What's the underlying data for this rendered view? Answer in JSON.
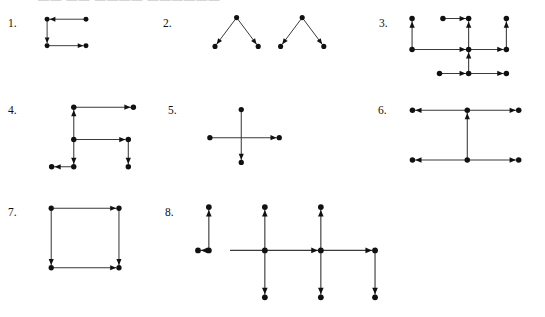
{
  "page": {
    "width": 545,
    "height": 317,
    "background_color": "#ffffff",
    "ink_color": "#111111",
    "line_color": "#3a3a3a",
    "faint_header_text": "—— ——  ————  ——————"
  },
  "problems": [
    {
      "number": "1.",
      "label_x": 8,
      "label_y": 18,
      "fig_x": 30,
      "fig_y": 8,
      "fig_w": 70,
      "fig_h": 45,
      "description": "Two horizontal segments joined by a left vertical segment; top arrow points left, vertical arrow points down, bottom arrow points right.",
      "nodes": [
        {
          "name": "n-top-left",
          "x": 8,
          "y": 8
        },
        {
          "name": "n-top-right",
          "x": 58,
          "y": 8
        },
        {
          "name": "n-bottom-left",
          "x": 8,
          "y": 42
        },
        {
          "name": "n-bottom-right",
          "x": 58,
          "y": 42
        }
      ],
      "edges": [
        {
          "name": "edge-top",
          "x1": 58,
          "y1": 8,
          "x2": 8,
          "y2": 8,
          "arrow": "end"
        },
        {
          "name": "edge-left",
          "x1": 8,
          "y1": 8,
          "x2": 8,
          "y2": 42,
          "arrow": "end"
        },
        {
          "name": "edge-bottom",
          "x1": 8,
          "y1": 42,
          "x2": 58,
          "y2": 42,
          "arrow": "end"
        }
      ]
    },
    {
      "number": "2.",
      "label_x": 163,
      "label_y": 18,
      "fig_x": 192,
      "fig_y": 8,
      "fig_w": 150,
      "fig_h": 48,
      "description": "Two separate inverted-V (peak) shapes; each peak node sends one arrow down-left and one arrow down-right.",
      "nodes": [
        {
          "name": "n-peak-a",
          "x": 33,
          "y": 6
        },
        {
          "name": "n-left-a",
          "x": 6,
          "y": 42
        },
        {
          "name": "n-right-a",
          "x": 60,
          "y": 42
        },
        {
          "name": "n-peak-b",
          "x": 115,
          "y": 6
        },
        {
          "name": "n-left-b",
          "x": 88,
          "y": 42
        },
        {
          "name": "n-right-b",
          "x": 142,
          "y": 42
        }
      ],
      "edges": [
        {
          "name": "edge-a-left",
          "x1": 33,
          "y1": 6,
          "x2": 6,
          "y2": 42,
          "arrow": "end"
        },
        {
          "name": "edge-a-right",
          "x1": 33,
          "y1": 6,
          "x2": 60,
          "y2": 42,
          "arrow": "end"
        },
        {
          "name": "edge-b-left",
          "x1": 115,
          "y1": 6,
          "x2": 88,
          "y2": 42,
          "arrow": "end"
        },
        {
          "name": "edge-b-right",
          "x1": 115,
          "y1": 6,
          "x2": 142,
          "y2": 42,
          "arrow": "end"
        }
      ]
    },
    {
      "number": "3.",
      "label_x": 379,
      "label_y": 18,
      "fig_x": 398,
      "fig_y": 10,
      "fig_w": 125,
      "fig_h": 72,
      "description": "Grid-like network: a central hub with up, right and left connections plus an upper branch and a lower branch.",
      "nodes": [
        {
          "name": "n-tl",
          "x": 2,
          "y": 4
        },
        {
          "name": "n-top-mid-left",
          "x": 38,
          "y": 4
        },
        {
          "name": "n-hub-top",
          "x": 68,
          "y": 4
        },
        {
          "name": "n-tr",
          "x": 112,
          "y": 4
        },
        {
          "name": "n-left-mid",
          "x": 2,
          "y": 40
        },
        {
          "name": "n-hub",
          "x": 68,
          "y": 40
        },
        {
          "name": "n-right-mid",
          "x": 112,
          "y": 40
        },
        {
          "name": "n-bottom-left",
          "x": 34,
          "y": 68
        },
        {
          "name": "n-bottom-hub",
          "x": 68,
          "y": 68
        },
        {
          "name": "n-bottom-right",
          "x": 112,
          "y": 68
        }
      ],
      "edges": [
        {
          "name": "edge-left-up",
          "x1": 2,
          "y1": 40,
          "x2": 2,
          "y2": 4,
          "arrow": "end"
        },
        {
          "name": "edge-top-right",
          "x1": 38,
          "y1": 4,
          "x2": 68,
          "y2": 4,
          "arrow": "end"
        },
        {
          "name": "edge-hub-up",
          "x1": 68,
          "y1": 40,
          "x2": 68,
          "y2": 4,
          "arrow": "end"
        },
        {
          "name": "edge-right-up",
          "x1": 112,
          "y1": 40,
          "x2": 112,
          "y2": 4,
          "arrow": "end"
        },
        {
          "name": "edge-mid-right",
          "x1": 2,
          "y1": 40,
          "x2": 68,
          "y2": 40,
          "arrow": "end"
        },
        {
          "name": "edge-hub-right",
          "x1": 68,
          "y1": 40,
          "x2": 112,
          "y2": 40,
          "arrow": "end"
        },
        {
          "name": "edge-bottom-up",
          "x1": 68,
          "y1": 68,
          "x2": 68,
          "y2": 40,
          "arrow": "end"
        },
        {
          "name": "edge-bottom-left-right",
          "x1": 34,
          "y1": 68,
          "x2": 68,
          "y2": 68,
          "arrow": "end"
        },
        {
          "name": "edge-bottom-hub-right",
          "x1": 68,
          "y1": 68,
          "x2": 112,
          "y2": 68,
          "arrow": "end"
        }
      ]
    },
    {
      "number": "4.",
      "label_x": 8,
      "label_y": 105,
      "fig_x": 38,
      "fig_y": 98,
      "fig_w": 115,
      "fig_h": 78,
      "description": "Staircase / zigzag path: right arrow at top, up arrow, right arrow in middle, two down arrows and a left arrow at the bottom.",
      "nodes": [
        {
          "name": "n-a",
          "x": 28,
          "y": 4
        },
        {
          "name": "n-b",
          "x": 98,
          "y": 4
        },
        {
          "name": "n-c",
          "x": 28,
          "y": 42
        },
        {
          "name": "n-d",
          "x": 92,
          "y": 42
        },
        {
          "name": "n-e",
          "x": 28,
          "y": 74
        },
        {
          "name": "n-f",
          "x": 92,
          "y": 74
        },
        {
          "name": "n-g",
          "x": 2,
          "y": 74
        }
      ],
      "edges": [
        {
          "name": "edge-top-right",
          "x1": 28,
          "y1": 4,
          "x2": 98,
          "y2": 4,
          "arrow": "end"
        },
        {
          "name": "edge-up",
          "x1": 28,
          "y1": 42,
          "x2": 28,
          "y2": 4,
          "arrow": "end"
        },
        {
          "name": "edge-mid-right",
          "x1": 28,
          "y1": 42,
          "x2": 92,
          "y2": 42,
          "arrow": "end"
        },
        {
          "name": "edge-down-left",
          "x1": 28,
          "y1": 42,
          "x2": 28,
          "y2": 74,
          "arrow": "end"
        },
        {
          "name": "edge-down-right",
          "x1": 92,
          "y1": 42,
          "x2": 92,
          "y2": 74,
          "arrow": "end"
        },
        {
          "name": "edge-bottom-left",
          "x1": 28,
          "y1": 74,
          "x2": 2,
          "y2": 74,
          "arrow": "end"
        }
      ]
    },
    {
      "number": "5.",
      "label_x": 168,
      "label_y": 105,
      "fig_x": 195,
      "fig_y": 100,
      "fig_w": 95,
      "fig_h": 72,
      "description": "Cross / plus shape with no centre node: a long horizontal arrow pointing right crossing a vertical arrow pointing down.",
      "nodes": [
        {
          "name": "n-top",
          "x": 42,
          "y": 4
        },
        {
          "name": "n-left",
          "x": 4,
          "y": 38
        },
        {
          "name": "n-right",
          "x": 88,
          "y": 38
        },
        {
          "name": "n-bottom",
          "x": 42,
          "y": 68
        }
      ],
      "edges": [
        {
          "name": "edge-horizontal",
          "x1": 4,
          "y1": 38,
          "x2": 88,
          "y2": 38,
          "arrow": "end"
        },
        {
          "name": "edge-vertical",
          "x1": 42,
          "y1": 4,
          "x2": 42,
          "y2": 68,
          "arrow": "end"
        }
      ]
    },
    {
      "number": "6.",
      "label_x": 378,
      "label_y": 105,
      "fig_x": 398,
      "fig_y": 100,
      "fig_w": 130,
      "fig_h": 72,
      "description": "Two long horizontal lines joined by a central vertical arrow pointing up; each horizontal line has a left-pointing and a right-pointing arrow.",
      "nodes": [
        {
          "name": "n-top-left",
          "x": 2,
          "y": 6
        },
        {
          "name": "n-top-mid",
          "x": 66,
          "y": 6
        },
        {
          "name": "n-top-right",
          "x": 126,
          "y": 6
        },
        {
          "name": "n-bottom-left",
          "x": 2,
          "y": 64
        },
        {
          "name": "n-bottom-mid",
          "x": 66,
          "y": 64
        },
        {
          "name": "n-bottom-right",
          "x": 126,
          "y": 64
        }
      ],
      "edges": [
        {
          "name": "edge-top-left",
          "x1": 66,
          "y1": 6,
          "x2": 2,
          "y2": 6,
          "arrow": "end"
        },
        {
          "name": "edge-top-right",
          "x1": 66,
          "y1": 6,
          "x2": 126,
          "y2": 6,
          "arrow": "end"
        },
        {
          "name": "edge-vertical-up",
          "x1": 66,
          "y1": 64,
          "x2": 66,
          "y2": 6,
          "arrow": "end"
        },
        {
          "name": "edge-bottom-left",
          "x1": 66,
          "y1": 64,
          "x2": 2,
          "y2": 64,
          "arrow": "end"
        },
        {
          "name": "edge-bottom-right",
          "x1": 66,
          "y1": 64,
          "x2": 126,
          "y2": 64,
          "arrow": "end"
        }
      ]
    },
    {
      "number": "7.",
      "label_x": 8,
      "label_y": 207,
      "fig_x": 38,
      "fig_y": 198,
      "fig_w": 95,
      "fig_h": 80,
      "description": "A square: top edge arrow to the right, bottom edge arrow to the right, both side edges arrows pointing down.",
      "nodes": [
        {
          "name": "n-tl",
          "x": 2,
          "y": 4
        },
        {
          "name": "n-tr",
          "x": 84,
          "y": 4
        },
        {
          "name": "n-bl",
          "x": 2,
          "y": 76
        },
        {
          "name": "n-br",
          "x": 84,
          "y": 76
        }
      ],
      "edges": [
        {
          "name": "edge-top",
          "x1": 2,
          "y1": 4,
          "x2": 84,
          "y2": 4,
          "arrow": "end"
        },
        {
          "name": "edge-left",
          "x1": 2,
          "y1": 4,
          "x2": 2,
          "y2": 76,
          "arrow": "end"
        },
        {
          "name": "edge-right",
          "x1": 84,
          "y1": 4,
          "x2": 84,
          "y2": 76,
          "arrow": "end"
        },
        {
          "name": "edge-bottom",
          "x1": 2,
          "y1": 76,
          "x2": 84,
          "y2": 76,
          "arrow": "end"
        }
      ]
    },
    {
      "number": "8.",
      "label_x": 165,
      "label_y": 207,
      "fig_x": 190,
      "fig_y": 198,
      "fig_w": 240,
      "fig_h": 112,
      "description": "A separate short vertical arrow pointing up with a small left arrow at its base, next to a long horizontal chain of three hubs; each hub has an up arrow and a down arrow, and the horizontal arrows point right.",
      "nodes": [
        {
          "name": "n-iso-top",
          "x": 4,
          "y": 4
        },
        {
          "name": "n-iso-bottom",
          "x": 4,
          "y": 52
        },
        {
          "name": "n-iso-left",
          "x": -8,
          "y": 52
        },
        {
          "name": "n-h1-top",
          "x": 66,
          "y": 4
        },
        {
          "name": "n-h1",
          "x": 66,
          "y": 52
        },
        {
          "name": "n-h1-bottom",
          "x": 66,
          "y": 104
        },
        {
          "name": "n-h2-top",
          "x": 128,
          "y": 4
        },
        {
          "name": "n-h2",
          "x": 128,
          "y": 52
        },
        {
          "name": "n-h2-bottom",
          "x": 128,
          "y": 104
        },
        {
          "name": "n-h3",
          "x": 188,
          "y": 52
        },
        {
          "name": "n-h3-bottom",
          "x": 188,
          "y": 104
        }
      ],
      "edges": [
        {
          "name": "edge-iso-up",
          "x1": 4,
          "y1": 52,
          "x2": 4,
          "y2": 4,
          "arrow": "end"
        },
        {
          "name": "edge-iso-left",
          "x1": 4,
          "y1": 52,
          "x2": -8,
          "y2": 52,
          "arrow": "end"
        },
        {
          "name": "edge-main-1",
          "x1": 28,
          "y1": 52,
          "x2": 128,
          "y2": 52,
          "arrow": "end"
        },
        {
          "name": "edge-main-2",
          "x1": 128,
          "y1": 52,
          "x2": 188,
          "y2": 52,
          "arrow": "end"
        },
        {
          "name": "edge-h1-up",
          "x1": 66,
          "y1": 52,
          "x2": 66,
          "y2": 4,
          "arrow": "end"
        },
        {
          "name": "edge-h1-down",
          "x1": 66,
          "y1": 52,
          "x2": 66,
          "y2": 104,
          "arrow": "end"
        },
        {
          "name": "edge-h2-up",
          "x1": 128,
          "y1": 52,
          "x2": 128,
          "y2": 4,
          "arrow": "end"
        },
        {
          "name": "edge-h2-down",
          "x1": 128,
          "y1": 52,
          "x2": 128,
          "y2": 104,
          "arrow": "end"
        },
        {
          "name": "edge-h3-down",
          "x1": 188,
          "y1": 52,
          "x2": 188,
          "y2": 104,
          "arrow": "end"
        }
      ]
    }
  ]
}
